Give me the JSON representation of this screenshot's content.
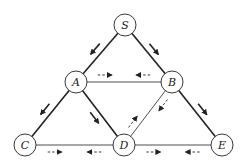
{
  "diagram": {
    "type": "flow-network",
    "nodes": [
      {
        "id": "S",
        "label": "S",
        "x": 125,
        "y": 25
      },
      {
        "id": "A",
        "label": "A",
        "x": 76,
        "y": 82
      },
      {
        "id": "B",
        "label": "B",
        "x": 172,
        "y": 82
      },
      {
        "id": "C",
        "label": "C",
        "x": 25,
        "y": 145
      },
      {
        "id": "D",
        "label": "D",
        "x": 124,
        "y": 145
      },
      {
        "id": "E",
        "label": "E",
        "x": 222,
        "y": 145
      }
    ],
    "edges": [
      {
        "from": "S",
        "to": "A",
        "weight": "thick",
        "arrows": [
          {
            "style": "solid",
            "dir": "S->A"
          }
        ]
      },
      {
        "from": "S",
        "to": "B",
        "weight": "thick",
        "arrows": [
          {
            "style": "solid",
            "dir": "S->B"
          }
        ]
      },
      {
        "from": "A",
        "to": "B",
        "weight": "thin",
        "arrows": [
          {
            "style": "dashed",
            "dir": "A->B"
          },
          {
            "style": "dashed",
            "dir": "B->A"
          }
        ]
      },
      {
        "from": "A",
        "to": "C",
        "weight": "thick",
        "arrows": [
          {
            "style": "solid",
            "dir": "A->C"
          }
        ]
      },
      {
        "from": "A",
        "to": "D",
        "weight": "thick",
        "arrows": [
          {
            "style": "solid",
            "dir": "A->D"
          }
        ]
      },
      {
        "from": "B",
        "to": "D",
        "weight": "thin",
        "arrows": [
          {
            "style": "dashed",
            "dir": "B->D"
          },
          {
            "style": "dashed",
            "dir": "D->B"
          }
        ]
      },
      {
        "from": "B",
        "to": "E",
        "weight": "thick",
        "arrows": [
          {
            "style": "solid",
            "dir": "B->E"
          }
        ]
      },
      {
        "from": "C",
        "to": "D",
        "weight": "thin",
        "arrows": [
          {
            "style": "dashed",
            "dir": "C->D"
          },
          {
            "style": "dashed",
            "dir": "D->C"
          }
        ]
      },
      {
        "from": "D",
        "to": "E",
        "weight": "thin",
        "arrows": [
          {
            "style": "dashed",
            "dir": "D->E"
          },
          {
            "style": "dashed",
            "dir": "E->D"
          }
        ]
      }
    ],
    "colors": {
      "line": "#222222",
      "node_fill": "#ffffff",
      "background": "#ffffff"
    }
  }
}
